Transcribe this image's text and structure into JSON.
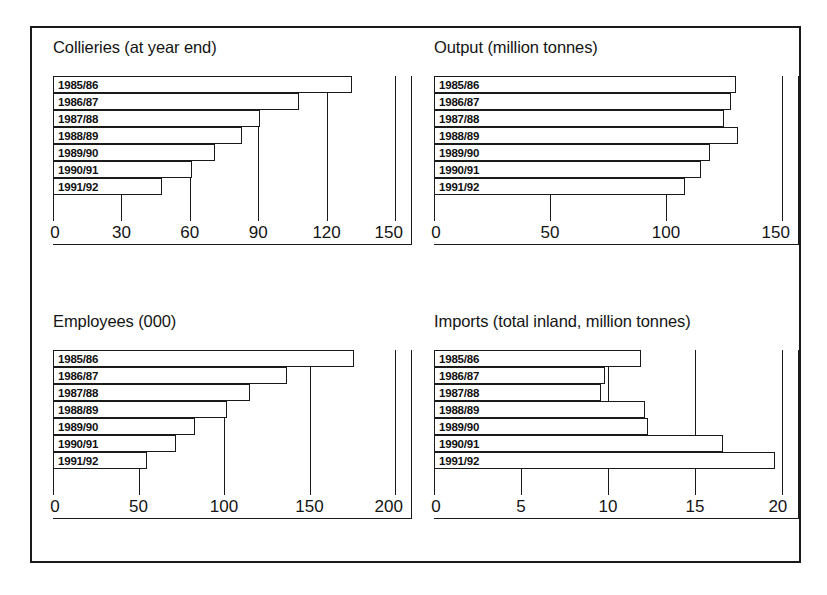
{
  "figure": {
    "background_color": "#ffffff",
    "line_color": "#1a1a1a",
    "bar_fill_color": "#ffffff"
  },
  "categories": [
    "1985/86",
    "1986/87",
    "1987/88",
    "1988/89",
    "1989/90",
    "1990/91",
    "1991/92"
  ],
  "panels": {
    "collieries": {
      "title": "Collieries (at year end)",
      "ticks": [
        "0",
        "30",
        "60",
        "90",
        "120",
        "150"
      ]
    },
    "output": {
      "title": "Output (million tonnes)",
      "ticks": [
        "0",
        "50",
        "100",
        "150"
      ]
    },
    "employees": {
      "title": "Employees (000)",
      "ticks": [
        "0",
        "50",
        "100",
        "150",
        "200"
      ]
    },
    "imports": {
      "title": "Imports (total inland, million tonnes)",
      "ticks": [
        "0",
        "5",
        "10",
        "15",
        "20"
      ]
    }
  },
  "chart_data": [
    {
      "type": "bar",
      "orientation": "horizontal",
      "title": "Collieries (at year end)",
      "xlabel": "",
      "ylabel": "",
      "categories": [
        "1985/86",
        "1986/87",
        "1987/88",
        "1988/89",
        "1989/90",
        "1990/91",
        "1991/92"
      ],
      "values": [
        131,
        108,
        91,
        83,
        71,
        61,
        48
      ],
      "xlim": [
        0,
        150
      ],
      "xticks": [
        0,
        30,
        60,
        90,
        120,
        150
      ],
      "grid": false,
      "legend": "none"
    },
    {
      "type": "bar",
      "orientation": "horizontal",
      "title": "Output (million tonnes)",
      "xlabel": "",
      "ylabel": "",
      "categories": [
        "1985/86",
        "1986/87",
        "1987/88",
        "1988/89",
        "1989/90",
        "1990/91",
        "1991/92"
      ],
      "values": [
        130,
        128,
        125,
        131,
        119,
        115,
        108
      ],
      "xlim": [
        0,
        150
      ],
      "xticks": [
        0,
        50,
        100,
        150
      ],
      "grid": false,
      "legend": "none"
    },
    {
      "type": "bar",
      "orientation": "horizontal",
      "title": "Employees (000)",
      "xlabel": "",
      "ylabel": "",
      "categories": [
        "1985/86",
        "1986/87",
        "1987/88",
        "1988/89",
        "1989/90",
        "1990/91",
        "1991/92"
      ],
      "values": [
        176,
        137,
        115,
        102,
        83,
        72,
        55
      ],
      "xlim": [
        0,
        200
      ],
      "xticks": [
        0,
        50,
        100,
        150,
        200
      ],
      "grid": false,
      "legend": "none"
    },
    {
      "type": "bar",
      "orientation": "horizontal",
      "title": "Imports (total inland, million tonnes)",
      "xlabel": "",
      "ylabel": "",
      "categories": [
        "1985/86",
        "1986/87",
        "1987/88",
        "1988/89",
        "1989/90",
        "1990/91",
        "1991/92"
      ],
      "values": [
        11.9,
        9.8,
        9.6,
        12.1,
        12.3,
        16.6,
        19.6
      ],
      "xlim": [
        0,
        20
      ],
      "xticks": [
        0,
        5,
        10,
        15,
        20
      ],
      "grid": false,
      "legend": "none"
    }
  ]
}
